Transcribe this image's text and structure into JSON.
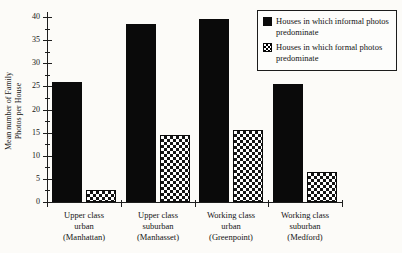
{
  "y_axis_title": {
    "line1": "Mean number of Family",
    "line2": "Photos per House"
  },
  "legend": {
    "items": [
      {
        "label": "Houses in which informal photos predominate",
        "swatch": "solid-black"
      },
      {
        "label": "Houses in which formal photos predominate",
        "swatch": "crosshatch"
      }
    ]
  },
  "chart_data": {
    "type": "bar",
    "title": "",
    "xlabel": "",
    "ylabel": "Mean number of Family Photos per House",
    "categories": [
      "Upper class\nurban\n(Manhattan)",
      "Upper class\nsuburban\n(Manhasset)",
      "Working class\nurban\n(Greenpoint)",
      "Working class\nsuburban\n(Medford)"
    ],
    "series": [
      {
        "name": "Houses in which informal photos predominate",
        "pattern": "solid",
        "values": [
          26,
          38.5,
          39.5,
          25.5
        ]
      },
      {
        "name": "Houses in which formal photos predominate",
        "pattern": "crosshatch",
        "values": [
          2.5,
          14.5,
          15.5,
          6.5
        ]
      }
    ],
    "ylim": [
      0,
      40
    ],
    "ytick_step": 5,
    "ytick_minor_step": 2.5,
    "ytick_labels": [
      "0",
      "5",
      "10",
      "15",
      "20",
      "25",
      "30",
      "35",
      "40"
    ],
    "grid": false,
    "legend_position": "top-right",
    "colors": {
      "bar_solid": "#0a0a0a",
      "axis": "#1e1e1e",
      "text": "#141414",
      "background": "#fcfbf8"
    }
  }
}
